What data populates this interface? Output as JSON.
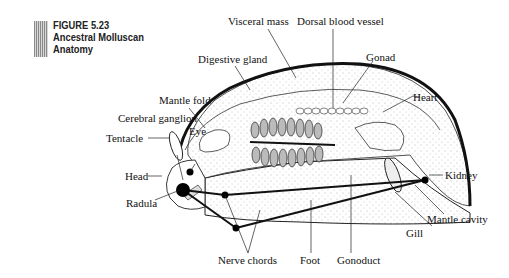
{
  "figure": {
    "number": "FIGURE 5.23",
    "title_line1": "Ancestral Molluscan",
    "title_line2": "Anatomy"
  },
  "labels": {
    "visceral_mass": "Visceral mass",
    "dorsal_blood_vessel": "Dorsal blood vessel",
    "digestive_gland": "Digestive gland",
    "gonad": "Gonad",
    "mantle_fold": "Mantle fold",
    "heart": "Heart",
    "cerebral_ganglion": "Cerebral ganglion",
    "eye": "Eye",
    "tentacle": "Tentacle",
    "kidney": "Kidney",
    "head": "Head",
    "radula": "Radula",
    "mantle_cavity": "Mantle cavity",
    "gill": "Gill",
    "nerve_chords": "Nerve chords",
    "foot": "Foot",
    "gonoduct": "Gonoduct"
  }
}
